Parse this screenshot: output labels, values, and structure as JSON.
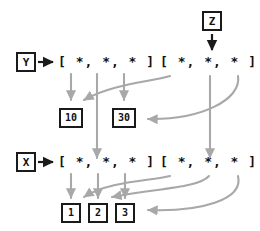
{
  "diagram": {
    "colors": {
      "ink": "#1a1a1a",
      "arrow_black": "#1a1a1a",
      "arrow_gray": "#a8a8a8",
      "background": "#ffffff"
    },
    "variables": [
      {
        "id": "var-z",
        "label": "Z"
      },
      {
        "id": "var-y",
        "label": "Y"
      },
      {
        "id": "var-x",
        "label": "X"
      }
    ],
    "lists": [
      {
        "id": "list-y-left",
        "text": "[ *, *, * ]"
      },
      {
        "id": "list-z-right",
        "text": "[ *, *, * ]"
      },
      {
        "id": "list-x-left",
        "text": "[ *, *, * ]"
      },
      {
        "id": "list-x-right",
        "text": "[ *, *, * ]"
      }
    ],
    "values": [
      {
        "id": "value-10",
        "label": "10"
      },
      {
        "id": "value-30",
        "label": "30"
      },
      {
        "id": "value-1",
        "label": "1"
      },
      {
        "id": "value-2",
        "label": "2"
      },
      {
        "id": "value-3",
        "label": "3"
      }
    ],
    "element_marker": "*",
    "bracket_open": "[",
    "bracket_close": "]"
  }
}
